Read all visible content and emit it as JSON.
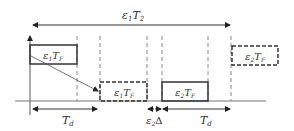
{
  "diagram": {
    "top_span": {
      "label_main": "ε",
      "label_sub1": "1",
      "label_t": "T",
      "label_sub2": "2"
    },
    "boxes": [
      {
        "id": "box-e1tf-solid",
        "eps": "ε",
        "eps_sub": "1",
        "t": "T",
        "t_sub": "F",
        "style": "solid"
      },
      {
        "id": "box-e1tf-dashed",
        "eps": "ε",
        "eps_sub": "1",
        "t": "T",
        "t_sub": "F",
        "style": "dashed"
      },
      {
        "id": "box-e2tf-solid",
        "eps": "ε",
        "eps_sub": "2",
        "t": "T",
        "t_sub": "F",
        "style": "solid"
      },
      {
        "id": "box-e2tf-dashed",
        "eps": "ε",
        "eps_sub": "2",
        "t": "T",
        "t_sub": "F",
        "style": "dashed"
      }
    ],
    "bottom_labels": {
      "td_left": {
        "t": "T",
        "sub": "d"
      },
      "delta": {
        "eps": "ε",
        "eps_sub": "2",
        "delta": "Δ"
      },
      "td_right": {
        "t": "T",
        "sub": "d"
      }
    }
  }
}
